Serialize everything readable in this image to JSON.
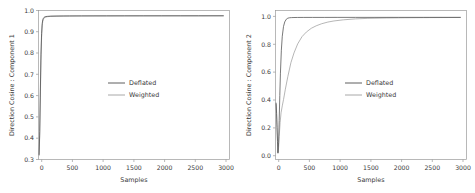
{
  "figure": {
    "background_color": "#ffffff",
    "panel_count": 2
  },
  "colors": {
    "deflated": "#4c4c4c",
    "weighted": "#9e9e9e",
    "axis": "#9a9a9a",
    "text": "#3a3a3a"
  },
  "legend": {
    "deflated_label": "Deflated",
    "weighted_label": "Weighted"
  },
  "axes": {
    "xlabel": "Samples",
    "xticks": [
      "0",
      "500",
      "1000",
      "1500",
      "2000",
      "2500",
      "3000"
    ],
    "left_ylabel": "Direction Cosine : Component 1",
    "left_yticks": [
      "0.3",
      "0.4",
      "0.5",
      "0.6",
      "0.7",
      "0.8",
      "0.9",
      "1.0"
    ],
    "right_ylabel": "Direction Cosine : Component 2",
    "right_yticks": [
      "0.0",
      "0.2",
      "0.4",
      "0.6",
      "0.8",
      "1.0"
    ]
  },
  "chart_data": [
    {
      "type": "line",
      "title": "",
      "xlabel": "Samples",
      "ylabel": "Direction Cosine : Component 1",
      "xlim": [
        0,
        3100
      ],
      "ylim": [
        0.28,
        1.02
      ],
      "xticks": [
        0,
        500,
        1000,
        1500,
        2000,
        2500,
        3000
      ],
      "yticks": [
        0.3,
        0.4,
        0.5,
        0.6,
        0.7,
        0.8,
        0.9,
        1.0
      ],
      "grid": false,
      "legend_position": "center",
      "series": [
        {
          "name": "Deflated",
          "color": "#4c4c4c",
          "x": [
            10,
            20,
            30,
            40,
            50,
            60,
            70,
            80,
            90,
            100,
            120,
            150,
            200,
            300,
            400,
            500,
            700,
            900,
            1100,
            1400,
            1700,
            2000,
            2300,
            2600,
            3000
          ],
          "y": [
            0.305,
            0.42,
            0.62,
            0.8,
            0.905,
            0.955,
            0.974,
            0.982,
            0.986,
            0.988,
            0.99,
            0.991,
            0.992,
            0.9925,
            0.9928,
            0.993,
            0.9932,
            0.9933,
            0.9934,
            0.9935,
            0.9936,
            0.9936,
            0.9937,
            0.9937,
            0.9938
          ]
        },
        {
          "name": "Weighted",
          "color": "#9e9e9e",
          "x": [
            10,
            20,
            30,
            40,
            50,
            60,
            70,
            80,
            90,
            100,
            120,
            150,
            200,
            300,
            400,
            500,
            700,
            900,
            1100,
            1400,
            1700,
            2000,
            2300,
            2600,
            3000
          ],
          "y": [
            0.3,
            0.4,
            0.59,
            0.77,
            0.885,
            0.944,
            0.967,
            0.977,
            0.982,
            0.985,
            0.9875,
            0.9895,
            0.9908,
            0.9918,
            0.9923,
            0.9926,
            0.9929,
            0.9931,
            0.9932,
            0.9933,
            0.9934,
            0.9935,
            0.9935,
            0.9936,
            0.9936
          ]
        }
      ]
    },
    {
      "type": "line",
      "title": "",
      "xlabel": "Samples",
      "ylabel": "Direction Cosine : Component 2",
      "xlim": [
        0,
        3100
      ],
      "ylim": [
        -0.03,
        1.04
      ],
      "xticks": [
        0,
        500,
        1000,
        1500,
        2000,
        2500,
        3000
      ],
      "yticks": [
        0.0,
        0.2,
        0.4,
        0.6,
        0.8,
        1.0
      ],
      "grid": false,
      "legend_position": "center",
      "series": [
        {
          "name": "Deflated",
          "color": "#4c4c4c",
          "x": [
            10,
            18,
            25,
            32,
            40,
            50,
            60,
            70,
            80,
            95,
            110,
            130,
            150,
            175,
            200,
            230,
            260,
            300,
            360,
            450,
            600,
            800,
            1000,
            1300,
            1600,
            2000,
            2400,
            2800,
            3000
          ],
          "y": [
            0.375,
            0.3,
            0.2,
            0.1,
            0.015,
            0.09,
            0.25,
            0.43,
            0.59,
            0.755,
            0.855,
            0.925,
            0.958,
            0.977,
            0.985,
            0.988,
            0.989,
            0.9895,
            0.99,
            0.9902,
            0.9903,
            0.9904,
            0.9905,
            0.9906,
            0.9906,
            0.9907,
            0.9907,
            0.9908,
            0.9908
          ]
        },
        {
          "name": "Weighted",
          "color": "#9e9e9e",
          "x": [
            10,
            20,
            30,
            40,
            50,
            60,
            75,
            90,
            110,
            130,
            160,
            200,
            250,
            300,
            360,
            430,
            500,
            580,
            660,
            750,
            850,
            950,
            1100,
            1300,
            1500,
            1800,
            2100,
            2500,
            2800,
            3000
          ],
          "y": [
            0.365,
            0.26,
            0.14,
            0.02,
            0.055,
            0.135,
            0.235,
            0.305,
            0.355,
            0.4,
            0.475,
            0.565,
            0.665,
            0.735,
            0.8,
            0.852,
            0.885,
            0.912,
            0.93,
            0.945,
            0.957,
            0.965,
            0.973,
            0.98,
            0.9835,
            0.9862,
            0.9878,
            0.989,
            0.9896,
            0.9899
          ]
        }
      ]
    }
  ]
}
